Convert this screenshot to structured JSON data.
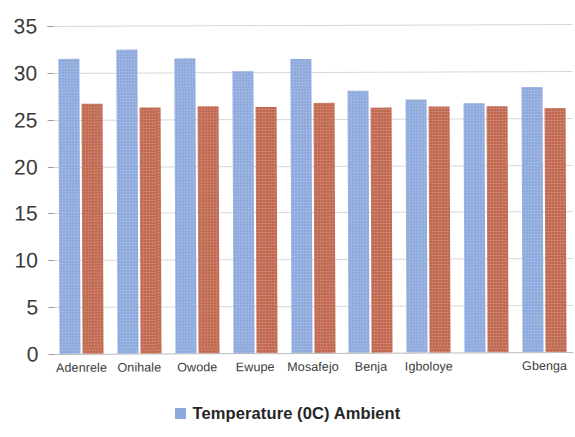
{
  "chart_data": {
    "type": "bar",
    "title": "",
    "xlabel": "",
    "ylabel": "",
    "ylim": [
      0,
      35
    ],
    "ytick_interval": 5,
    "ytick_labels": [
      "0",
      "5",
      "10",
      "15",
      "20",
      "25",
      "30",
      "35"
    ],
    "grid": true,
    "legend_position": "bottom",
    "categories": [
      "Adenrele",
      "Onihale",
      "Owode",
      "Ewupe",
      "Mosafejo",
      "Benja",
      "Igboloye",
      "",
      "Gbenga"
    ],
    "series": [
      {
        "name": "Temperature (0C) Ambient",
        "color": "#8ca8dc",
        "values": [
          31.5,
          32.4,
          31.5,
          30.1,
          31.4,
          28.0,
          27.0,
          26.6,
          28.3
        ]
      },
      {
        "name": "",
        "color": "#c0674e",
        "values": [
          26.7,
          26.2,
          26.4,
          26.2,
          26.7,
          26.1,
          26.2,
          26.2,
          26.0
        ]
      }
    ]
  },
  "legend": {
    "entries": [
      {
        "label": "Temperature (0C) Ambient",
        "color": "#8ca8dc"
      }
    ]
  },
  "colors": {
    "series_blue": "#8ca8dc",
    "series_red": "#c0674e",
    "gridline": "#c9c9c9",
    "text": "#3a3a3a"
  }
}
